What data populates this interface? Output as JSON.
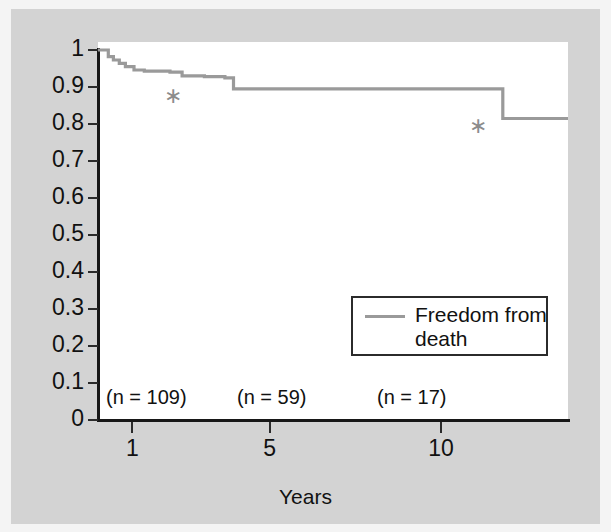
{
  "figure": {
    "background_color": "#d3d3d3",
    "plot_background_color": "#ffffff",
    "curve_color": "#9a9a9a",
    "axis_color": "#171717",
    "star_glyph": "∗"
  },
  "chart_data": {
    "type": "line",
    "subtype": "kaplan-meier-step",
    "title": "",
    "xlabel": "Years",
    "ylabel": "",
    "xlim": [
      0,
      13.7
    ],
    "ylim": [
      0,
      1
    ],
    "grid": false,
    "legend_position": "inside-lower-right",
    "xticks": [
      1,
      5,
      10
    ],
    "xtick_labels": [
      "1",
      "5",
      "10"
    ],
    "yticks": [
      0,
      0.1,
      0.2,
      0.3,
      0.4,
      0.5,
      0.6,
      0.7,
      0.8,
      0.9,
      1
    ],
    "ytick_labels": [
      "0",
      "0.1",
      "0.2",
      "0.3",
      "0.4",
      "0.5",
      "0.6",
      "0.7",
      "0.8",
      "0.9",
      "1"
    ],
    "series": [
      {
        "name": "Freedom from death",
        "color": "#9a9a9a",
        "points": [
          {
            "x": 0.0,
            "y": 1.0
          },
          {
            "x": 0.15,
            "y": 1.0
          },
          {
            "x": 0.3,
            "y": 0.982
          },
          {
            "x": 0.45,
            "y": 0.973
          },
          {
            "x": 0.62,
            "y": 0.964
          },
          {
            "x": 0.8,
            "y": 0.955
          },
          {
            "x": 1.05,
            "y": 0.946
          },
          {
            "x": 1.35,
            "y": 0.943
          },
          {
            "x": 2.1,
            "y": 0.94
          },
          {
            "x": 2.45,
            "y": 0.93
          },
          {
            "x": 3.1,
            "y": 0.928
          },
          {
            "x": 3.7,
            "y": 0.925
          },
          {
            "x": 3.95,
            "y": 0.895
          },
          {
            "x": 8.0,
            "y": 0.895
          },
          {
            "x": 11.6,
            "y": 0.895
          },
          {
            "x": 11.8,
            "y": 0.815
          },
          {
            "x": 13.7,
            "y": 0.815
          }
        ]
      }
    ],
    "annotations": [
      {
        "label": "∗",
        "x": 2.1,
        "y": 0.875,
        "name": "censor-star-1"
      },
      {
        "label": "∗",
        "x": 11.0,
        "y": 0.795,
        "name": "censor-star-2"
      }
    ],
    "at_risk_counts": [
      {
        "label": "(n = 109)",
        "x_px": 106
      },
      {
        "label": "(n = 59)",
        "x_px": 237
      },
      {
        "label": "(n = 17)",
        "x_px": 377
      }
    ]
  },
  "legend": {
    "line_label": "Freedom from death"
  },
  "axis": {
    "x_title": "Years"
  }
}
